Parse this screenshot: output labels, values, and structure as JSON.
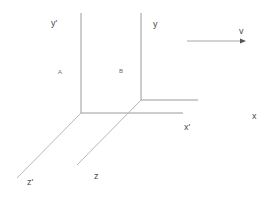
{
  "diagram": {
    "title": "",
    "colors": {
      "background": "#ffffff",
      "axis": "#9a9a9a",
      "depth_axis": "#b8b8b8",
      "text": "#4a4a4a",
      "arrow_head": "#555555"
    },
    "frames": [
      {
        "name": "primed",
        "origin": [
          81,
          113
        ],
        "axes": {
          "y": {
            "label": "y'",
            "from": [
              81,
              113
            ],
            "to": [
              81,
              13
            ]
          },
          "x": {
            "label": "x'",
            "from": [
              81,
              113
            ],
            "to": [
              183,
              113
            ]
          },
          "z": {
            "label": "z'",
            "from": [
              81,
              113
            ],
            "to": [
              17,
              178
            ]
          }
        },
        "point_label": "A"
      },
      {
        "name": "unprimed",
        "origin": [
          141,
          100
        ],
        "axes": {
          "y": {
            "label": "y",
            "from": [
              141,
              100
            ],
            "to": [
              141,
              13
            ]
          },
          "x": {
            "label": "x",
            "from": [
              141,
              100
            ],
            "to": [
              198,
              100
            ]
          },
          "z": {
            "label": "z",
            "from": [
              141,
              100
            ],
            "to": [
              77,
              165
            ]
          }
        },
        "point_label": "B"
      }
    ],
    "velocity": {
      "label": "v",
      "from": [
        187,
        41
      ],
      "to": [
        245,
        41
      ]
    },
    "labels": {
      "y_prime": "y'",
      "y": "y",
      "x_prime": "x'",
      "x": "x",
      "z_prime": "z'",
      "z": "z",
      "A": "A",
      "B": "B",
      "v": "v"
    }
  }
}
